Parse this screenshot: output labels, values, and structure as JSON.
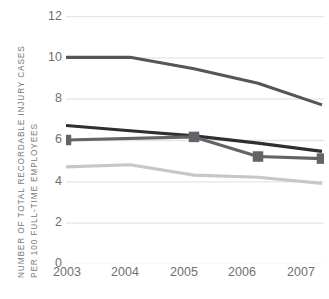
{
  "chart_data": {
    "type": "line",
    "title": "",
    "subtitle": "",
    "xlabel": "",
    "ylabel": "NUMBER OF TOTAL RECORDABLE INJURY CASES PER 100 FULL-TIME EMPLOYEES",
    "ylabel_lines": [
      "NUMBER OF TOTAL RECORDABLE INJURY CASES",
      "PER 100 FULL-TIME EMPLOYEES"
    ],
    "categories": [
      "2003",
      "2004",
      "2005",
      "2006",
      "2007"
    ],
    "ylim": [
      0,
      12
    ],
    "yticks": [
      "12",
      "10",
      "8",
      "6",
      "4",
      "2",
      "0"
    ],
    "ytick_values": [
      12,
      10,
      8,
      6,
      4,
      2,
      0
    ],
    "grid": "horizontal",
    "legend": "none",
    "series": [
      {
        "name": "series-1-dark-gray",
        "color": "#55555a",
        "marker": "none",
        "values": [
          10.0,
          10.0,
          9.45,
          8.75,
          7.7
        ]
      },
      {
        "name": "series-2-black",
        "color": "#2f2f33",
        "marker": "none",
        "values": [
          6.7,
          6.45,
          6.2,
          5.85,
          5.45
        ]
      },
      {
        "name": "series-3-square-markers",
        "color": "#646468",
        "marker": "square",
        "values": [
          6.0,
          null,
          6.15,
          5.2,
          5.1
        ]
      },
      {
        "name": "series-4-light-gray",
        "color": "#c7c7c7",
        "marker": "none",
        "values": [
          4.7,
          4.8,
          4.3,
          4.2,
          3.9
        ]
      }
    ],
    "colors": {
      "gridline": "#e6e6e6",
      "axis_text": "#6f6f6f",
      "background": "#ffffff"
    }
  }
}
